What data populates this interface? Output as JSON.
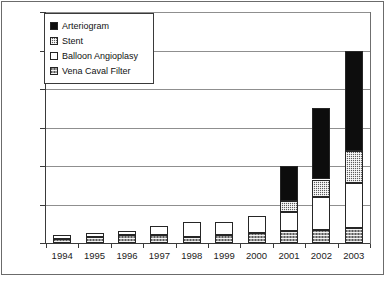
{
  "figure": {
    "title": "",
    "frame_color": "#6b6b6b"
  },
  "legend": {
    "position": "top-left-inside",
    "entries": [
      {
        "label": "Arteriogram",
        "pattern": "solid-black",
        "color": "#0d0d0d",
        "swatch_name": "legend-swatch-arteriogram"
      },
      {
        "label": "Stent",
        "pattern": "checkered",
        "color": "#5d5d5d",
        "swatch_name": "legend-swatch-stent"
      },
      {
        "label": "Balloon Angioplasy",
        "pattern": "white",
        "color": "#ffffff",
        "swatch_name": "legend-swatch-balloon-angioplasy"
      },
      {
        "label": "Vena Caval Filter",
        "pattern": "gray-hatch",
        "color": "#9a9a9a",
        "swatch_name": "legend-swatch-vena-caval-filter"
      }
    ]
  },
  "axes": {
    "y_ticks": [
      "0",
      "20",
      "40",
      "60",
      "80",
      "100",
      "120"
    ],
    "x_ticks": [
      "1994",
      "1995",
      "1996",
      "1997",
      "1998",
      "1999",
      "2000",
      "2001",
      "2002",
      "2003"
    ]
  },
  "chart_data": {
    "type": "bar",
    "stacked": true,
    "title": "",
    "xlabel": "",
    "ylabel": "",
    "ylim": [
      0,
      120
    ],
    "ytick_step": 20,
    "grid": true,
    "legend_position": "upper left",
    "categories": [
      "1994",
      "1995",
      "1996",
      "1997",
      "1998",
      "1999",
      "2000",
      "2001",
      "2002",
      "2003"
    ],
    "stack_order_bottom_to_top": [
      "Vena Caval Filter",
      "Balloon Angioplasy",
      "Stent",
      "Arteriogram"
    ],
    "series": [
      {
        "name": "Vena Caval Filter",
        "pattern": "gray-hatch",
        "color": "#9a9a9a",
        "values": [
          2,
          3,
          4,
          4,
          3,
          4,
          5,
          6,
          7,
          8
        ]
      },
      {
        "name": "Balloon Angioplasy",
        "pattern": "white",
        "color": "#ffffff",
        "values": [
          2,
          2,
          2,
          5,
          8,
          7,
          9,
          10,
          17,
          23
        ]
      },
      {
        "name": "Stent",
        "pattern": "checkered",
        "color": "#5d5d5d",
        "values": [
          0,
          0,
          0,
          0,
          0,
          0,
          0,
          6,
          9,
          17
        ]
      },
      {
        "name": "Arteriogram",
        "pattern": "solid-black",
        "color": "#0d0d0d",
        "values": [
          0,
          0,
          0,
          0,
          0,
          0,
          0,
          18,
          37,
          52
        ]
      }
    ],
    "totals": [
      4,
      5,
      6,
      9,
      11,
      11,
      14,
      40,
      70,
      100
    ]
  }
}
